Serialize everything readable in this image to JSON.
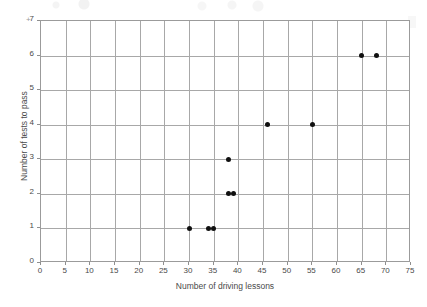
{
  "chart_data": {
    "type": "scatter",
    "title": "",
    "xlabel": "Number of driving lessons",
    "ylabel": "Number of tests to pass",
    "xlim": [
      0,
      75
    ],
    "ylim": [
      0,
      7
    ],
    "xticks": [
      0,
      5,
      10,
      15,
      20,
      25,
      30,
      35,
      40,
      45,
      50,
      55,
      60,
      65,
      70,
      75
    ],
    "yticks": [
      0,
      1,
      2,
      3,
      4,
      5,
      6,
      7
    ],
    "xtick_labels": [
      "0",
      "5",
      "10",
      "15",
      "20",
      "25",
      "30",
      "35",
      "40",
      "45",
      "50",
      "55",
      "60",
      "65",
      "70",
      "75"
    ],
    "ytick_labels": [
      "0",
      "1",
      "2",
      "3",
      "4",
      "5",
      "6",
      "7"
    ],
    "grid": true,
    "legend": false,
    "marker": "filled-circle",
    "marker_color": "#101010",
    "gridline_color": "#a8a8a8",
    "axis_color": "#9b9b9b",
    "background": "#ffffff",
    "points": [
      {
        "x": 30,
        "y": 1
      },
      {
        "x": 34,
        "y": 1
      },
      {
        "x": 35,
        "y": 1
      },
      {
        "x": 38,
        "y": 2
      },
      {
        "x": 39,
        "y": 2
      },
      {
        "x": 38,
        "y": 3
      },
      {
        "x": 46,
        "y": 4
      },
      {
        "x": 55,
        "y": 4
      },
      {
        "x": 65,
        "y": 6
      },
      {
        "x": 68,
        "y": 6
      }
    ],
    "x": [
      30,
      34,
      35,
      38,
      39,
      38,
      46,
      55,
      65,
      68
    ],
    "values": [
      1,
      1,
      1,
      2,
      2,
      3,
      4,
      4,
      6,
      6
    ],
    "n_points": 10
  }
}
